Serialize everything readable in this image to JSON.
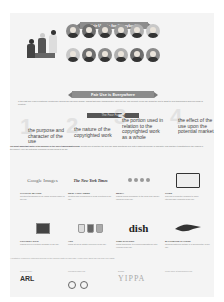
{
  "header": {
    "title": "Fair Use is for Everybody"
  },
  "people_group": {
    "figures": 3
  },
  "avatars": {
    "rows": [
      [
        "#8a8a8a",
        "#6e6e6e",
        "#8a8a8a",
        "#9a9a9a",
        "#b0b0b0",
        "#c8c8c8"
      ],
      [
        "#c8c8c8",
        "#6e6e6e",
        "#8a8a8a",
        "#b0b0b0",
        "#6e6e6e",
        "#8a8a8a"
      ]
    ]
  },
  "everywhere": {
    "title": "Fair Use is Everywhere",
    "intro": "In the past few years in particular, courts have applied fair use more broadly, finding that many transformative uses are fair. The flexibility of fair use allows the law to adapt to new technologies and new forms of creativity.",
    "factors_label": "The Four Factors"
  },
  "factors": [
    {
      "num": "1",
      "text": "the purpose and character of the use"
    },
    {
      "num": "2",
      "text": "the nature of the copyrighted work"
    },
    {
      "num": "3",
      "text": "the portion used in relation to the copyrighted work as a whole"
    },
    {
      "num": "4",
      "text": "the effect of the use upon the potential market"
    }
  ],
  "summary": {
    "lead": "The most important factor is the purpose or the use's transformativeness.",
    "body": "Courts look at whether the new use adds something new, with a different purpose or character, and whether it substitutes for the original in the market. Here are just some examples of uses found to be fair."
  },
  "cases": [
    {
      "logo": "Google Images",
      "title": "GOOGLE IMAGES",
      "desc": "Creating thumbnails for an image search engine is fair use."
    },
    {
      "logo": "The New York Times",
      "title": "NEW YORK TIMES",
      "desc": "Quoting and reproducing in news reporting is fair use."
    },
    {
      "logo": "circles",
      "title": "MEDIA",
      "desc": "Making works accessible to the blind and visually impaired is fair use."
    },
    {
      "logo": "monitor",
      "title": "CODE",
      "desc": "Copying a computer program to make interoperable products is fair use."
    },
    {
      "logo": "protest-sign",
      "title": "PROTEST SIGN",
      "desc": "Making fun of a political message is fair use."
    },
    {
      "logo": "paint-jars",
      "title": "ART",
      "desc": "Using art as an artistic reference is fair use."
    },
    {
      "logo": "dish",
      "title": "TIME-SHIFTING",
      "desc": "Using technology to record broadcasts for later viewing is fair use."
    },
    {
      "logo": "ravens",
      "title": "BALTIMORE RAVENS",
      "desc": "Showing historical footage in a documentary is fair use."
    }
  ],
  "footnote": "* Illustrative examples; outcomes depend on the specific facts of each case. Learn more about fair use and your rights.",
  "sponsors": [
    {
      "caption": "Developed by",
      "name": "ARL"
    },
    {
      "caption": "Licensed under CC",
      "name": "CC BY"
    },
    {
      "caption": "Design",
      "name": "YIPPA"
    },
    {
      "caption": "",
      "name": "Learn more at fairuseweek.org"
    }
  ]
}
